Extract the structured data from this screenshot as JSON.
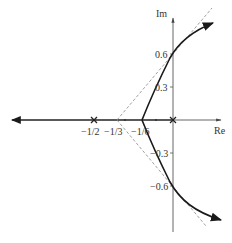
{
  "diagram": {
    "type": "root-locus",
    "axes": {
      "real_label": "Re",
      "imag_label": "Im"
    },
    "real_axis_labels": [
      "−1/2",
      "−1/3",
      "−1/6"
    ],
    "imag_axis_labels": [
      "0.6",
      "0.3",
      "−0.3",
      "−0.6"
    ],
    "poles": [
      {
        "re": "0",
        "label": "pole at origin"
      },
      {
        "re": "-1/2",
        "label": "pole at -1/2"
      }
    ],
    "asymptote_centroid": "−1/3",
    "breakaway_point": "−1/6",
    "imag_axis_crossings": [
      "0.6",
      "−0.6"
    ],
    "colors": {
      "locus": "#1a1a1a",
      "axis": "#555555",
      "asymptote": "#888888"
    }
  }
}
